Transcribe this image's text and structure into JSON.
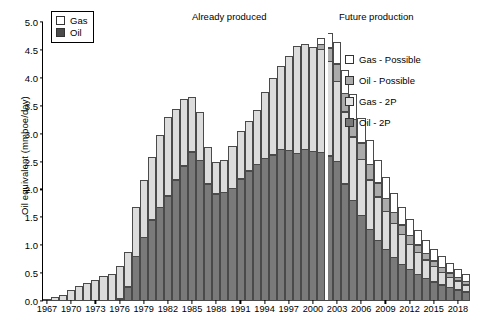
{
  "legend_main": {
    "items": [
      {
        "label": "Gas",
        "icon": "square-outline-icon",
        "color": "#ffffff"
      },
      {
        "label": "Oil",
        "icon": "square-filled-icon",
        "color": "#4a4a4a"
      }
    ]
  },
  "legend_detail": {
    "items": [
      {
        "label": "Gas - Possible",
        "icon": "square-white-icon",
        "color": "#ffffff"
      },
      {
        "label": "Oil - Possible",
        "icon": "square-midgray-icon",
        "color": "#ababab"
      },
      {
        "label": "Gas - 2P",
        "icon": "square-lightgray-icon",
        "color": "#e3e3e3"
      },
      {
        "label": "Oil - 2P",
        "icon": "square-darkgray-icon",
        "color": "#7a7a7a"
      }
    ]
  },
  "annotations": {
    "left": "Already produced",
    "right": "Future production"
  },
  "chart_data": {
    "type": "bar",
    "title": "",
    "subtitle": "",
    "xlabel": "",
    "ylabel": "Oil equivalent (mmboe/day)",
    "ylim": [
      0.0,
      5.0
    ],
    "ytick_labels": [
      "0.0",
      "0.5",
      "1.0",
      "1.5",
      "2.0",
      "2.5",
      "3.0",
      "3.5",
      "4.0",
      "4.5",
      "5.0"
    ],
    "ytick_values": [
      0.0,
      0.5,
      1.0,
      1.5,
      2.0,
      2.5,
      3.0,
      3.5,
      4.0,
      4.5,
      5.0
    ],
    "grid": false,
    "stacked": true,
    "legend_position": "top-left and right",
    "categories": [
      1967,
      1968,
      1969,
      1970,
      1971,
      1972,
      1973,
      1974,
      1975,
      1976,
      1977,
      1978,
      1979,
      1980,
      1981,
      1982,
      1983,
      1984,
      1985,
      1986,
      1987,
      1988,
      1989,
      1990,
      1991,
      1992,
      1993,
      1994,
      1995,
      1996,
      1997,
      1998,
      1999,
      2000,
      2001,
      2002,
      2003,
      2004,
      2005,
      2006,
      2007,
      2008,
      2009,
      2010,
      2011,
      2012,
      2013,
      2014,
      2015,
      2016,
      2017,
      2018,
      2019
    ],
    "xtick_labels": [
      "1967",
      "1970",
      "1973",
      "1976",
      "1979",
      "1982",
      "1985",
      "1988",
      "1991",
      "1994",
      "1997",
      "2000",
      "2003",
      "2006",
      "2009",
      "2012",
      "2015",
      "2018"
    ],
    "divider_after_category": 2001,
    "divider_label": "boundary between already produced and future production",
    "series": [
      {
        "name": "Oil - 2P",
        "color": "#7a7a7a",
        "values": [
          0.0,
          0.0,
          0.0,
          0.0,
          0.0,
          0.0,
          0.0,
          0.0,
          0.0,
          0.03,
          0.25,
          0.8,
          1.14,
          1.45,
          1.68,
          1.88,
          2.17,
          2.42,
          2.67,
          2.52,
          2.1,
          1.92,
          1.95,
          2.02,
          2.19,
          2.33,
          2.45,
          2.56,
          2.62,
          2.71,
          2.7,
          2.65,
          2.72,
          2.68,
          2.66,
          2.6,
          2.5,
          2.1,
          1.8,
          1.53,
          1.28,
          1.08,
          0.92,
          0.78,
          0.66,
          0.56,
          0.48,
          0.41,
          0.34,
          0.29,
          0.24,
          0.2,
          0.16
        ]
      },
      {
        "name": "Gas - 2P",
        "color": "#e3e3e3",
        "values": [
          0.03,
          0.06,
          0.1,
          0.2,
          0.27,
          0.31,
          0.38,
          0.44,
          0.48,
          0.59,
          0.63,
          0.89,
          1.03,
          1.13,
          1.3,
          1.42,
          1.28,
          1.21,
          1.0,
          0.88,
          0.66,
          0.58,
          0.58,
          0.76,
          0.86,
          0.9,
          0.98,
          1.2,
          1.38,
          1.5,
          1.7,
          1.92,
          1.9,
          1.88,
          1.86,
          1.7,
          1.45,
          1.3,
          1.15,
          1.02,
          0.9,
          0.8,
          0.7,
          0.62,
          0.54,
          0.47,
          0.4,
          0.34,
          0.29,
          0.24,
          0.2,
          0.17,
          0.14
        ]
      },
      {
        "name": "Oil - Possible",
        "color": "#ababab",
        "values": [
          0,
          0,
          0,
          0,
          0,
          0,
          0,
          0,
          0,
          0,
          0,
          0,
          0,
          0,
          0,
          0,
          0,
          0,
          0,
          0,
          0,
          0,
          0,
          0,
          0,
          0,
          0,
          0,
          0,
          0,
          0,
          0,
          0,
          0,
          0.1,
          0.26,
          0.32,
          0.34,
          0.33,
          0.31,
          0.29,
          0.26,
          0.24,
          0.21,
          0.19,
          0.17,
          0.15,
          0.13,
          0.11,
          0.1,
          0.09,
          0.08,
          0.07
        ]
      },
      {
        "name": "Gas - Possible",
        "color": "#ffffff",
        "values": [
          0,
          0,
          0,
          0,
          0,
          0,
          0,
          0,
          0,
          0,
          0,
          0,
          0,
          0,
          0,
          0,
          0,
          0,
          0,
          0,
          0,
          0,
          0,
          0,
          0,
          0,
          0,
          0,
          0,
          0,
          0,
          0,
          0,
          0,
          0.12,
          0.28,
          0.4,
          0.44,
          0.46,
          0.46,
          0.44,
          0.42,
          0.39,
          0.36,
          0.33,
          0.3,
          0.27,
          0.24,
          0.22,
          0.2,
          0.18,
          0.16,
          0.15
        ]
      }
    ],
    "totals_note": "Bars up to 2001 show Already produced (Oil-2P + Gas-2P). Bars from 2002 show Future production with four stacked components."
  }
}
